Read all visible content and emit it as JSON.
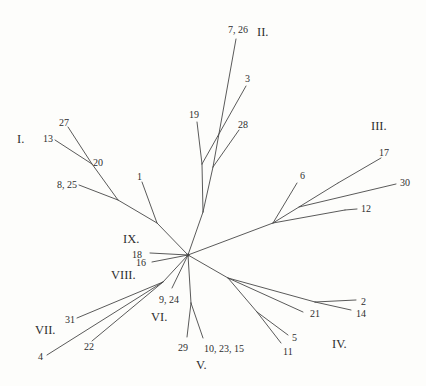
{
  "figure": {
    "width": 426,
    "height": 386,
    "background": "#fdfdfb",
    "line_color": "#474747",
    "label_color": "#2e2e2e",
    "hub": {
      "x": 188,
      "y": 255,
      "radius": 1.6
    },
    "edges": [
      [
        68,
        127,
        92,
        164
      ],
      [
        55,
        140,
        92,
        164
      ],
      [
        92,
        164,
        118,
        200
      ],
      [
        79,
        185,
        118,
        200
      ],
      [
        118,
        200,
        157,
        223
      ],
      [
        142,
        182,
        157,
        223
      ],
      [
        157,
        223,
        188,
        255
      ],
      [
        188,
        255,
        203,
        212
      ],
      [
        203,
        212,
        202,
        164
      ],
      [
        202,
        164,
        197,
        122
      ],
      [
        202,
        164,
        246,
        86
      ],
      [
        203,
        212,
        213,
        167
      ],
      [
        213,
        167,
        239,
        130
      ],
      [
        213,
        167,
        236,
        39
      ],
      [
        188,
        255,
        273,
        223
      ],
      [
        273,
        223,
        297,
        183
      ],
      [
        273,
        223,
        338,
        183
      ],
      [
        338,
        183,
        381,
        158
      ],
      [
        299,
        207,
        396,
        184
      ],
      [
        273,
        223,
        345,
        210
      ],
      [
        345,
        210,
        357,
        209
      ],
      [
        188,
        255,
        228,
        278
      ],
      [
        228,
        278,
        303,
        312
      ],
      [
        228,
        278,
        315,
        302
      ],
      [
        315,
        302,
        356,
        300
      ],
      [
        315,
        302,
        351,
        310
      ],
      [
        228,
        278,
        257,
        312
      ],
      [
        257,
        312,
        288,
        335
      ],
      [
        257,
        312,
        281,
        343
      ],
      [
        188,
        255,
        191,
        303
      ],
      [
        191,
        303,
        187,
        337
      ],
      [
        191,
        303,
        203,
        338
      ],
      [
        188,
        255,
        172,
        288
      ],
      [
        188,
        255,
        163,
        282
      ],
      [
        163,
        282,
        77,
        318
      ],
      [
        163,
        282,
        92,
        341
      ],
      [
        163,
        282,
        47,
        355
      ],
      [
        188,
        255,
        150,
        253
      ],
      [
        188,
        255,
        152,
        262
      ]
    ],
    "leaf_labels": [
      {
        "text": "27",
        "x": 59,
        "y": 126
      },
      {
        "text": "13",
        "x": 43,
        "y": 142
      },
      {
        "text": "20",
        "x": 93,
        "y": 166
      },
      {
        "text": "8, 25",
        "x": 57,
        "y": 188
      },
      {
        "text": "1",
        "x": 137,
        "y": 180
      },
      {
        "text": "19",
        "x": 189,
        "y": 118
      },
      {
        "text": "7, 26",
        "x": 228,
        "y": 33
      },
      {
        "text": "3",
        "x": 245,
        "y": 82
      },
      {
        "text": "28",
        "x": 238,
        "y": 128
      },
      {
        "text": "17",
        "x": 379,
        "y": 156
      },
      {
        "text": "6",
        "x": 300,
        "y": 179
      },
      {
        "text": "30",
        "x": 400,
        "y": 186
      },
      {
        "text": "12",
        "x": 361,
        "y": 212
      },
      {
        "text": "2",
        "x": 361,
        "y": 305
      },
      {
        "text": "21",
        "x": 310,
        "y": 317
      },
      {
        "text": "14",
        "x": 356,
        "y": 317
      },
      {
        "text": "5",
        "x": 292,
        "y": 341
      },
      {
        "text": "11",
        "x": 283,
        "y": 355
      },
      {
        "text": "10, 23, 15",
        "x": 204,
        "y": 352
      },
      {
        "text": "29",
        "x": 178,
        "y": 351
      },
      {
        "text": "9, 24",
        "x": 159,
        "y": 303
      },
      {
        "text": "16",
        "x": 136,
        "y": 266
      },
      {
        "text": "18",
        "x": 132,
        "y": 258
      },
      {
        "text": "31",
        "x": 65,
        "y": 323
      },
      {
        "text": "22",
        "x": 84,
        "y": 350
      },
      {
        "text": "4",
        "x": 38,
        "y": 360
      }
    ],
    "group_labels": [
      {
        "text": "I.",
        "x": 17,
        "y": 143
      },
      {
        "text": "II.",
        "x": 257,
        "y": 36
      },
      {
        "text": "III.",
        "x": 371,
        "y": 130
      },
      {
        "text": "IV.",
        "x": 332,
        "y": 348
      },
      {
        "text": "V.",
        "x": 196,
        "y": 369
      },
      {
        "text": "VI.",
        "x": 151,
        "y": 321
      },
      {
        "text": "VII.",
        "x": 35,
        "y": 334
      },
      {
        "text": "VIII.",
        "x": 111,
        "y": 279
      },
      {
        "text": "IX.",
        "x": 123,
        "y": 243
      }
    ]
  }
}
